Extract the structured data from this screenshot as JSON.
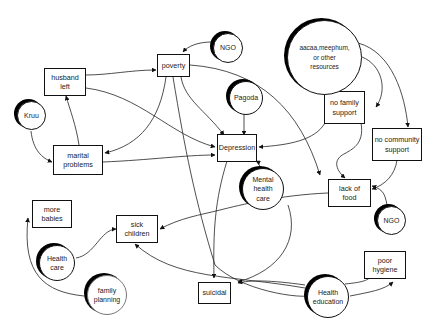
{
  "diagram": {
    "type": "causal-loop",
    "problems": {
      "husband_left": "husband\nleft",
      "poverty": "poverty",
      "marital_problems": "marital\nproblems",
      "depression": "Depression",
      "no_family_support": "no family\nsupport",
      "no_community_support": "no community\nsupport",
      "lack_of_food": "lack of\nfood",
      "more_babies": "more\nbabies",
      "sick_children": "sick\nchildren",
      "suicidal": "suicidal",
      "poor_hygiene": "poor\nhygiene"
    },
    "resources": {
      "ngo_top": "NGO",
      "kruu": "Kruu",
      "pagoda": "Pagoda",
      "aacaa": "aacaa,meephum,\nor other\nresources",
      "mental_health_care": "Mental\nhealth\ncare",
      "ngo_bottom": "NGO",
      "health_care": "Health\ncare",
      "family_planning": "family\nplanning",
      "health_education": "Health\neducation"
    },
    "edges": [
      {
        "from": "ngo_top",
        "to": "poverty"
      },
      {
        "from": "husband_left",
        "to": "poverty"
      },
      {
        "from": "husband_left",
        "to": "depression"
      },
      {
        "from": "kruu",
        "to": "marital_problems"
      },
      {
        "from": "marital_problems",
        "to": "husband_left"
      },
      {
        "from": "marital_problems",
        "to": "depression"
      },
      {
        "from": "poverty",
        "to": "marital_problems"
      },
      {
        "from": "poverty",
        "to": "depression"
      },
      {
        "from": "poverty",
        "to": "lack_of_food"
      },
      {
        "from": "poverty",
        "to": "suicidal"
      },
      {
        "from": "pagoda",
        "to": "depression"
      },
      {
        "from": "aacaa",
        "to": "no_family_support"
      },
      {
        "from": "aacaa",
        "to": "no_community_support"
      },
      {
        "from": "no_family_support",
        "to": "depression"
      },
      {
        "from": "no_family_support",
        "to": "lack_of_food"
      },
      {
        "from": "no_community_support",
        "to": "lack_of_food"
      },
      {
        "from": "ngo_bottom",
        "to": "lack_of_food"
      },
      {
        "from": "mental_health_care",
        "to": "depression"
      },
      {
        "from": "lack_of_food",
        "to": "sick_children"
      },
      {
        "from": "depression",
        "to": "suicidal"
      },
      {
        "from": "mental_health_care",
        "to": "suicidal"
      },
      {
        "from": "health_care",
        "to": "sick_children"
      },
      {
        "from": "family_planning",
        "to": "more_babies"
      },
      {
        "from": "health_education",
        "to": "sick_children"
      },
      {
        "from": "health_education",
        "to": "suicidal"
      },
      {
        "from": "health_education",
        "to": "poor_hygiene"
      }
    ]
  }
}
